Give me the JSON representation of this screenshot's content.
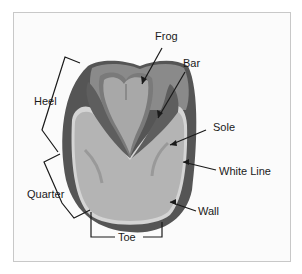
{
  "diagram": {
    "labels": {
      "frog": "Frog",
      "bar": "Bar",
      "sole": "Sole",
      "white_line": "White Line",
      "wall": "Wall",
      "heel": "Heel",
      "quarter": "Quarter",
      "toe": "Toe"
    },
    "colors": {
      "background": "#fbfbfb",
      "frame_border": "#c8c8c8",
      "wall": "#555555",
      "heel_bulb": "#8a8a8a",
      "bar": "#5e5e5e",
      "sole": "#b4b4b4",
      "frog": "#a8a8a8",
      "frog_outline": "#7a7a7a",
      "white_line": "#d4d4d4",
      "lines": "#1a1a1a"
    }
  }
}
